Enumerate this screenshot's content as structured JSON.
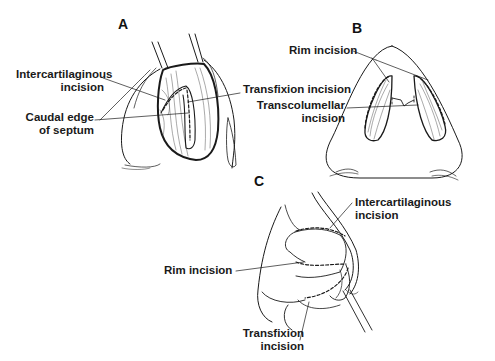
{
  "figure": {
    "panels": [
      {
        "id": "A",
        "labels": {
          "intercartilaginous_1": "Intercartilaginous",
          "intercartilaginous_2": "incision",
          "caudal_1": "Caudal edge",
          "caudal_2": "of septum",
          "transfixion": "Transfixion incision"
        }
      },
      {
        "id": "B",
        "labels": {
          "rim": "Rim incision",
          "transcolumellar_1": "Transcolumellar",
          "transcolumellar_2": "incision"
        }
      },
      {
        "id": "C",
        "labels": {
          "intercartilaginous_1": "Intercartilaginous",
          "intercartilaginous_2": "incision",
          "rim": "Rim incision",
          "transfixion_1": "Transfixion",
          "transfixion_2": "incision"
        }
      }
    ]
  }
}
